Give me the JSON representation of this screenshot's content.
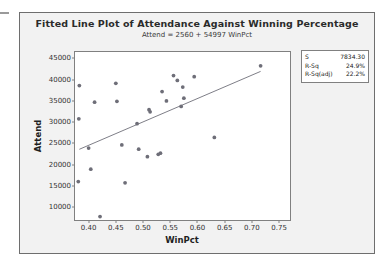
{
  "chart_data": {
    "type": "scatter",
    "title": "Fitted Line Plot of Attendance Against Winning Percentage",
    "subtitle": "Attend =  2560 + 54997 WinPct",
    "xlabel": "WinPct",
    "ylabel": "Attend",
    "xlim": [
      0.375,
      0.77
    ],
    "ylim": [
      7000,
      46500
    ],
    "xticks": [
      "0.40",
      "0.45",
      "0.50",
      "0.55",
      "0.60",
      "0.65",
      "0.70",
      "0.75"
    ],
    "xtick_values": [
      0.4,
      0.45,
      0.5,
      0.55,
      0.6,
      0.65,
      0.7,
      0.75
    ],
    "yticks": [
      "10000",
      "15000",
      "20000",
      "25000",
      "30000",
      "35000",
      "40000",
      "45000"
    ],
    "ytick_values": [
      10000,
      15000,
      20000,
      25000,
      30000,
      35000,
      40000,
      45000
    ],
    "grid": false,
    "legend": "none",
    "marker_color": "#6e6e78",
    "line_color": "#6e6e78",
    "fit": {
      "intercept": 2560,
      "slope": 54997,
      "equation": "Attend =  2560 + 54997 WinPct",
      "x_start": 0.383,
      "x_end": 0.716
    },
    "points": [
      {
        "x": 0.383,
        "y": 38600
      },
      {
        "x": 0.382,
        "y": 30800
      },
      {
        "x": 0.381,
        "y": 16050
      },
      {
        "x": 0.4,
        "y": 23900
      },
      {
        "x": 0.404,
        "y": 18950
      },
      {
        "x": 0.411,
        "y": 34700
      },
      {
        "x": 0.421,
        "y": 7800
      },
      {
        "x": 0.45,
        "y": 39150
      },
      {
        "x": 0.452,
        "y": 34900
      },
      {
        "x": 0.461,
        "y": 24650
      },
      {
        "x": 0.467,
        "y": 15750
      },
      {
        "x": 0.489,
        "y": 29650
      },
      {
        "x": 0.492,
        "y": 23650
      },
      {
        "x": 0.508,
        "y": 21900
      },
      {
        "x": 0.511,
        "y": 32950
      },
      {
        "x": 0.513,
        "y": 32450
      },
      {
        "x": 0.528,
        "y": 22450
      },
      {
        "x": 0.532,
        "y": 22700
      },
      {
        "x": 0.535,
        "y": 37200
      },
      {
        "x": 0.543,
        "y": 35000
      },
      {
        "x": 0.556,
        "y": 40950
      },
      {
        "x": 0.563,
        "y": 39800
      },
      {
        "x": 0.57,
        "y": 33700
      },
      {
        "x": 0.573,
        "y": 38250
      },
      {
        "x": 0.575,
        "y": 35650
      },
      {
        "x": 0.594,
        "y": 40700
      },
      {
        "x": 0.631,
        "y": 26400
      },
      {
        "x": 0.716,
        "y": 43250
      }
    ]
  },
  "stats_box": {
    "rows": [
      {
        "key": "S",
        "value": "7834.30"
      },
      {
        "key": "R-Sq",
        "value": "24.9%"
      },
      {
        "key": "R-Sq(adj)",
        "value": "22.2%"
      }
    ]
  }
}
